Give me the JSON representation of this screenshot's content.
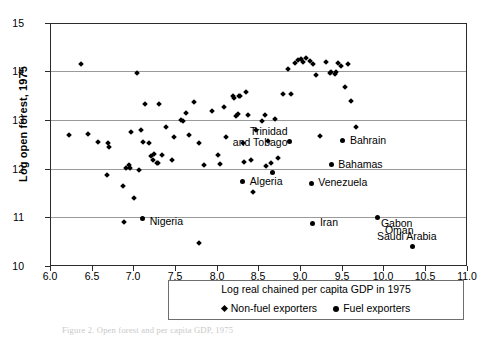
{
  "figure": {
    "caption": "Figure 2.  Open forest and per capita GDP, 1975"
  },
  "axes": {
    "y_label": "Log open forest, 1975",
    "y_ticks": [
      "15",
      "14",
      "13",
      "12",
      "11",
      "10"
    ],
    "x_ticks": [
      "6.0",
      "6.5",
      "7.0",
      "7.5",
      "8.0",
      "8.5",
      "9.0",
      "9.5",
      "10.0",
      "10.5",
      "11.0"
    ]
  },
  "legend": {
    "title": "Log real chained per capita GDP in 1975",
    "items": [
      {
        "marker": "diamond-marker",
        "label": "Non-fuel exporters"
      },
      {
        "marker": "circle-marker",
        "label": "Fuel exporters"
      }
    ]
  },
  "chart_data": {
    "type": "scatter",
    "title": "",
    "xlabel": "Log real chained per capita GDP in 1975",
    "ylabel": "Log open forest, 1975",
    "xlim": [
      6.0,
      11.0
    ],
    "ylim": [
      10.0,
      15.0
    ],
    "grid": "horizontal-only",
    "legend_position": "below-plot",
    "series": [
      {
        "name": "Non-fuel exporters",
        "marker": "diamond",
        "points": [
          [
            6.36,
            14.17
          ],
          [
            6.22,
            12.72
          ],
          [
            6.44,
            12.73
          ],
          [
            6.56,
            12.57
          ],
          [
            6.68,
            12.56
          ],
          [
            6.7,
            12.46
          ],
          [
            6.67,
            11.89
          ],
          [
            6.86,
            11.66
          ],
          [
            6.88,
            10.92
          ],
          [
            6.9,
            12.03
          ],
          [
            6.93,
            12.1
          ],
          [
            6.95,
            12.04
          ],
          [
            6.96,
            12.77
          ],
          [
            7.0,
            11.43
          ],
          [
            7.03,
            13.99
          ],
          [
            7.05,
            12.0
          ],
          [
            7.08,
            12.82
          ],
          [
            7.1,
            12.58
          ],
          [
            7.13,
            13.35
          ],
          [
            7.18,
            12.55
          ],
          [
            7.2,
            12.28
          ],
          [
            7.22,
            12.21
          ],
          [
            7.24,
            12.33
          ],
          [
            7.27,
            12.13
          ],
          [
            7.28,
            12.15
          ],
          [
            7.3,
            13.36
          ],
          [
            7.33,
            12.3
          ],
          [
            7.38,
            12.89
          ],
          [
            7.45,
            12.21
          ],
          [
            7.48,
            12.68
          ],
          [
            7.56,
            13.02
          ],
          [
            7.58,
            13.0
          ],
          [
            7.62,
            13.16
          ],
          [
            7.66,
            12.71
          ],
          [
            7.72,
            13.39
          ],
          [
            7.78,
            12.55
          ],
          [
            7.78,
            10.5
          ],
          [
            7.84,
            12.1
          ],
          [
            7.93,
            13.22
          ],
          [
            8.0,
            12.3
          ],
          [
            8.03,
            12.12
          ],
          [
            8.08,
            13.3
          ],
          [
            8.1,
            12.67
          ],
          [
            8.18,
            13.52
          ],
          [
            8.2,
            13.48
          ],
          [
            8.22,
            13.1
          ],
          [
            8.24,
            13.14
          ],
          [
            8.25,
            13.52
          ],
          [
            8.27,
            13.51
          ],
          [
            8.3,
            12.55
          ],
          [
            8.32,
            12.17
          ],
          [
            8.34,
            13.6
          ],
          [
            8.36,
            13.13
          ],
          [
            8.4,
            12.21
          ],
          [
            8.42,
            11.55
          ],
          [
            8.46,
            12.82
          ],
          [
            8.53,
            13.0
          ],
          [
            8.56,
            13.12
          ],
          [
            8.58,
            12.08
          ],
          [
            8.6,
            12.6
          ],
          [
            8.64,
            12.13
          ],
          [
            8.68,
            13.05
          ],
          [
            8.72,
            12.25
          ],
          [
            8.78,
            13.56
          ],
          [
            8.84,
            14.08
          ],
          [
            8.88,
            13.55
          ],
          [
            8.92,
            14.2
          ],
          [
            8.96,
            14.25
          ],
          [
            9.0,
            14.28
          ],
          [
            9.02,
            14.22
          ],
          [
            9.06,
            14.3
          ],
          [
            9.1,
            14.24
          ],
          [
            9.14,
            14.18
          ],
          [
            9.18,
            13.95
          ],
          [
            9.22,
            12.7
          ],
          [
            9.3,
            14.22
          ],
          [
            9.34,
            14.0
          ],
          [
            9.36,
            14.02
          ],
          [
            9.4,
            13.98
          ],
          [
            9.42,
            14.02
          ],
          [
            9.44,
            14.2
          ],
          [
            9.48,
            14.14
          ],
          [
            9.52,
            13.7
          ],
          [
            9.56,
            14.18
          ],
          [
            9.6,
            13.42
          ],
          [
            9.66,
            12.88
          ]
        ]
      },
      {
        "name": "Fuel exporters",
        "marker": "circle",
        "points": [
          [
            7.1,
            11.0
          ],
          [
            8.3,
            11.75
          ],
          [
            8.66,
            11.95
          ],
          [
            8.86,
            12.58
          ],
          [
            9.12,
            11.72
          ],
          [
            9.14,
            10.9
          ],
          [
            9.36,
            12.1
          ],
          [
            9.5,
            12.6
          ],
          [
            9.92,
            11.02
          ],
          [
            10.34,
            10.42
          ]
        ]
      }
    ],
    "annotations": [
      {
        "label": "Trinidad\nand Tobago",
        "country": "Trinidad and Tobago",
        "x": 8.86,
        "y": 12.58
      },
      {
        "label": "Bahrain",
        "country": "Bahrain",
        "x": 9.5,
        "y": 12.6
      },
      {
        "label": "Bahamas",
        "country": "Bahamas",
        "x": 9.36,
        "y": 12.1
      },
      {
        "label": "Algeria",
        "country": "Algeria",
        "x": 8.3,
        "y": 11.75
      },
      {
        "label": "Venezuela",
        "country": "Venezuela",
        "x": 9.12,
        "y": 11.72
      },
      {
        "label": "Nigeria",
        "country": "Nigeria",
        "x": 7.1,
        "y": 11.0
      },
      {
        "label": "Iran",
        "country": "Iran",
        "x": 9.14,
        "y": 10.9
      },
      {
        "label": "Gabon",
        "country": "Gabon",
        "x": 9.92,
        "y": 11.02
      },
      {
        "label": "Oman",
        "country": "Oman",
        "x": 9.92,
        "y": 10.74
      },
      {
        "label": "Saudi Arabia",
        "country": "Saudi Arabia",
        "x": 10.34,
        "y": 10.42
      }
    ]
  }
}
